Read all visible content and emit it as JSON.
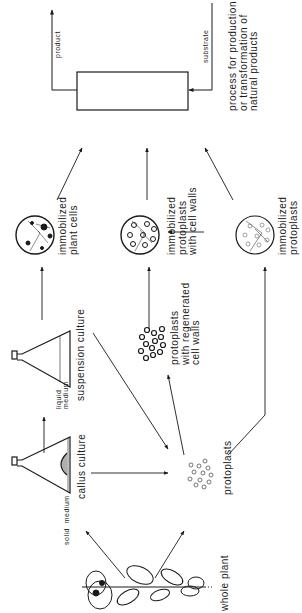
{
  "diagram": {
    "orientation": "rotated -90deg",
    "nodes": {
      "whole_plant": "whole plant",
      "callus_culture": "callus culture",
      "suspension_culture": "suspension culture",
      "protoplasts": "protoplasts",
      "protoplasts_regenerated": "protoplasts\nwith regenerated\ncell walls",
      "immobilized_plant_cells": "immobilized\nplant cells",
      "immobilized_protoplasts_cell_walls": "immobilized\nprotoplasts\nwith cell walls",
      "immobilized_protoplasts": "immobilized\nprotoplasts",
      "process": "process for production\nor transformation of\nnatural products"
    },
    "edge_labels": {
      "solid_medium": "solid  medium",
      "liquid_medium": "liquid\nmedium",
      "product": "product",
      "substrate": "substrate"
    },
    "colors": {
      "ink": "#1a1a1a",
      "background": "#ffffff"
    }
  }
}
